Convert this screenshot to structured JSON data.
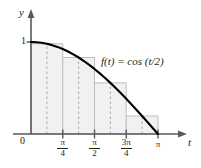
{
  "figure": {
    "title": "",
    "function_label": "f(t) = cos (t/2)",
    "axis_labels": {
      "x": "t",
      "y": "y"
    },
    "origin_label": "0",
    "y_tick_label": "1"
  },
  "ticks": {
    "x": [
      {
        "id": "pi-over-4",
        "num": "π",
        "den": "4",
        "value": 0.7853981634
      },
      {
        "id": "pi-over-2",
        "num": "π",
        "den": "2",
        "value": 1.5707963268
      },
      {
        "id": "three-pi-over-4",
        "num": "3π",
        "den": "4",
        "value": 2.3561944902
      },
      {
        "id": "pi",
        "num": "π",
        "den": "",
        "value": 3.1415926536
      }
    ],
    "y": [
      {
        "id": "one",
        "label": "1",
        "value": 1
      }
    ]
  },
  "colors": {
    "curve": "#000000",
    "axis": "#58595b",
    "rect_stroke": "#bcbec0",
    "rect_fill": "#f1f1f2",
    "dashed": "#a7a9ac",
    "text": "#231f20"
  },
  "chart_data": {
    "type": "area",
    "title": "",
    "xlabel": "t",
    "ylabel": "y",
    "xlim": [
      0,
      3.4557519189
    ],
    "ylim": [
      0,
      1.18
    ],
    "grid": false,
    "legend": "none",
    "annotations": [
      {
        "text": "f(t) = cos (t/2)",
        "x": 1.8,
        "y": 0.72
      }
    ],
    "xticks": [
      0,
      0.7853981634,
      1.5707963268,
      2.3561944902,
      3.1415926536
    ],
    "xticklabels": [
      "0",
      "π/4",
      "π/2",
      "3π/4",
      "π"
    ],
    "yticks": [
      1
    ],
    "yticklabels": [
      "1"
    ],
    "series": [
      {
        "name": "f(t) = cos (t/2)",
        "type": "line",
        "x": [
          0.0,
          0.1308997,
          0.2617994,
          0.3926991,
          0.5235988,
          0.6544985,
          0.7853982,
          0.9162979,
          1.0471976,
          1.1780972,
          1.3089969,
          1.4398966,
          1.5707963,
          1.701696,
          1.8325957,
          1.9634954,
          2.0943951,
          2.2252948,
          2.3561945,
          2.4870942,
          2.6179939,
          2.7488936,
          2.8797933,
          3.010693,
          3.1415927
        ],
        "y": [
          1.0,
          0.997859,
          0.991445,
          0.980785,
          0.965926,
          0.94693,
          0.92388,
          0.896873,
          0.866025,
          0.83147,
          0.793353,
          0.75184,
          0.707107,
          0.659346,
          0.608761,
          0.55557,
          0.5,
          0.442289,
          0.382683,
          0.321439,
          0.258819,
          0.19509,
          0.130526,
          0.065403,
          0.0
        ]
      },
      {
        "name": "midpoint rectangles",
        "type": "bar",
        "rule": "midpoint",
        "n": 4,
        "edges": [
          0.0,
          0.7853982,
          1.5707963,
          2.3561945,
          3.1415927
        ],
        "midpoints": [
          0.3926991,
          1.1780972,
          1.9634954,
          2.7488936
        ],
        "heights": [
          0.980785,
          0.83147,
          0.55557,
          0.19509
        ],
        "width": 0.7853982
      }
    ]
  }
}
